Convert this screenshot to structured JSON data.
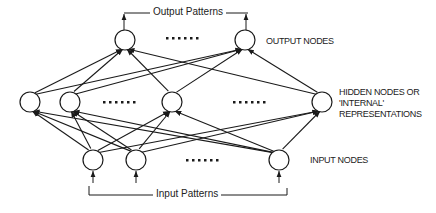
{
  "diagram": {
    "type": "neural-network",
    "colors": {
      "stroke": "#1a1a1a",
      "background": "#ffffff",
      "text": "#222222"
    },
    "labels": {
      "output_patterns": "Output Patterns",
      "input_patterns": "Input Patterns",
      "output_nodes": "OUTPUT NODES",
      "hidden_nodes_line1": "HIDDEN NODES OR",
      "hidden_nodes_line2": "'INTERNAL'",
      "hidden_nodes_line3": "REPRESENTATIONS",
      "input_nodes": "INPUT NODES",
      "ellipsis": "......"
    },
    "layers": {
      "output": [
        {
          "id": "o1",
          "x": 125,
          "y": 40
        },
        {
          "id": "o2",
          "x": 245,
          "y": 40
        }
      ],
      "hidden": [
        {
          "id": "h1",
          "x": 30,
          "y": 102
        },
        {
          "id": "h2",
          "x": 70,
          "y": 102
        },
        {
          "id": "h3",
          "x": 172,
          "y": 102
        },
        {
          "id": "h4",
          "x": 322,
          "y": 102
        }
      ],
      "input": [
        {
          "id": "i1",
          "x": 93,
          "y": 160
        },
        {
          "id": "i2",
          "x": 136,
          "y": 160
        },
        {
          "id": "i3",
          "x": 279,
          "y": 160
        }
      ]
    },
    "node_radius": 10,
    "connections": "fully connected input->hidden and hidden->output with arrowheads"
  }
}
